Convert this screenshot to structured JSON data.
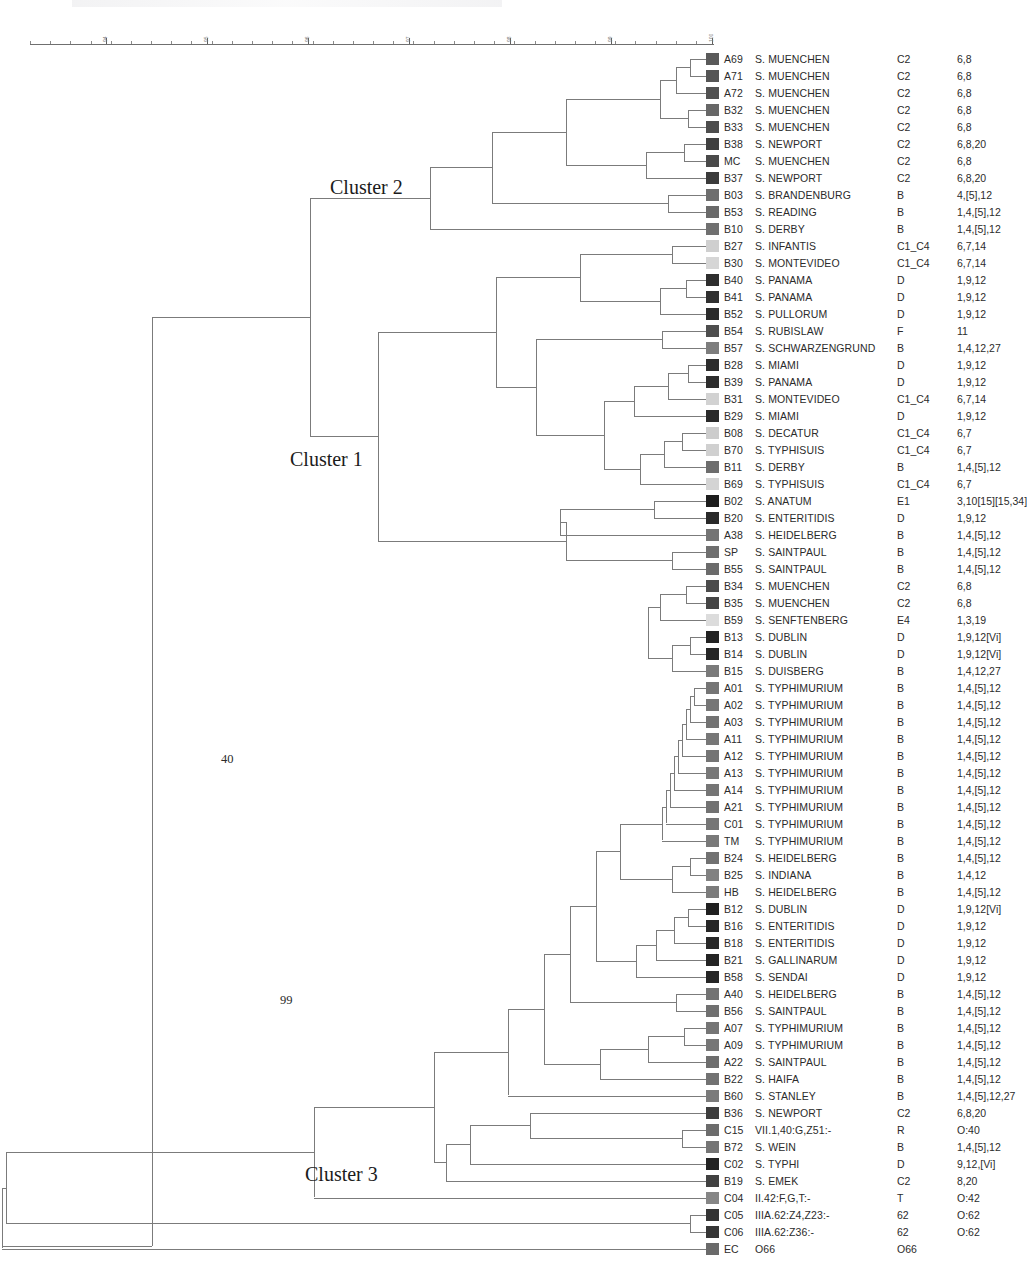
{
  "figure": {
    "type": "dendrogram",
    "line_color": "#7b7b7b",
    "text_color": "#2b2b2b"
  },
  "axis": {
    "orientation": "horizontal-top",
    "label_rotation": "vertical",
    "min": 93.5,
    "max": 100,
    "ticks": [
      {
        "value": "94",
        "x": 106
      },
      {
        "value": "95",
        "x": 207
      },
      {
        "value": "96",
        "x": 308
      },
      {
        "value": "97",
        "x": 409
      },
      {
        "value": "98",
        "x": 510
      },
      {
        "value": "99",
        "x": 611
      },
      {
        "value": "100",
        "x": 712
      }
    ]
  },
  "annotations": {
    "cluster1": "Cluster 1",
    "cluster2": "Cluster 2",
    "cluster3": "Cluster 3",
    "bootstrap_40": "40",
    "bootstrap_99": "99"
  },
  "columns": {
    "id": "Strain ID",
    "name": "Serovar",
    "group": "Serogroup",
    "antigen": "Antigenic formula"
  },
  "chart_data": {
    "type": "dendrogram",
    "title": "",
    "xlabel": "",
    "ylabel": "",
    "xlim": [
      93.5,
      100
    ],
    "leaf_count": 71
  },
  "rows": [
    {
      "id": "A69",
      "name": "S. MUENCHEN",
      "group": "C2",
      "antigen": "6,8",
      "color": "#5a5a5a"
    },
    {
      "id": "A71",
      "name": "S. MUENCHEN",
      "group": "C2",
      "antigen": "6,8",
      "color": "#555555"
    },
    {
      "id": "A72",
      "name": "S. MUENCHEN",
      "group": "C2",
      "antigen": "6,8",
      "color": "#515151"
    },
    {
      "id": "B32",
      "name": "S. MUENCHEN",
      "group": "C2",
      "antigen": "6,8",
      "color": "#676767"
    },
    {
      "id": "B33",
      "name": "S. MUENCHEN",
      "group": "C2",
      "antigen": "6,8",
      "color": "#4d4d4d"
    },
    {
      "id": "B38",
      "name": "S. NEWPORT",
      "group": "C2",
      "antigen": "6,8,20",
      "color": "#3f3f3f"
    },
    {
      "id": "MC",
      "name": "S. MUENCHEN",
      "group": "C2",
      "antigen": "6,8",
      "color": "#4a4a4a"
    },
    {
      "id": "B37",
      "name": "S. NEWPORT",
      "group": "C2",
      "antigen": "6,8,20",
      "color": "#3b3b3b"
    },
    {
      "id": "B03",
      "name": "S. BRANDENBURG",
      "group": "B",
      "antigen": "4,[5],12",
      "color": "#6e6e6e"
    },
    {
      "id": "B53",
      "name": "S. READING",
      "group": "B",
      "antigen": "1,4,[5],12",
      "color": "#6a6a6a"
    },
    {
      "id": "B10",
      "name": "S. DERBY",
      "group": "B",
      "antigen": "1,4,[5],12",
      "color": "#707070"
    },
    {
      "id": "B27",
      "name": "S. INFANTIS",
      "group": "C1_C4",
      "antigen": "6,7,14",
      "color": "#cfcfcf"
    },
    {
      "id": "B30",
      "name": "S. MONTEVIDEO",
      "group": "C1_C4",
      "antigen": "6,7,14",
      "color": "#d6d6d6"
    },
    {
      "id": "B40",
      "name": "S. PANAMA",
      "group": "D",
      "antigen": "1,9,12",
      "color": "#2e2e2e"
    },
    {
      "id": "B41",
      "name": "S. PANAMA",
      "group": "D",
      "antigen": "1,9,12",
      "color": "#303030"
    },
    {
      "id": "B52",
      "name": "S. PULLORUM",
      "group": "D",
      "antigen": "1,9,12",
      "color": "#2b2b2b"
    },
    {
      "id": "B54",
      "name": "S. RUBISLAW",
      "group": "F",
      "antigen": "11",
      "color": "#4e4e4e"
    },
    {
      "id": "B57",
      "name": "S. SCHWARZENGRUND",
      "group": "B",
      "antigen": "1,4,12,27",
      "color": "#7d7d7d"
    },
    {
      "id": "B28",
      "name": "S. MIAMI",
      "group": "D",
      "antigen": "1,9,12",
      "color": "#2c2c2c"
    },
    {
      "id": "B39",
      "name": "S. PANAMA",
      "group": "D",
      "antigen": "1,9,12",
      "color": "#2d2d2d"
    },
    {
      "id": "B31",
      "name": "S. MONTEVIDEO",
      "group": "C1_C4",
      "antigen": "6,7,14",
      "color": "#d2d2d2"
    },
    {
      "id": "B29",
      "name": "S. MIAMI",
      "group": "D",
      "antigen": "1,9,12",
      "color": "#2a2a2a"
    },
    {
      "id": "B08",
      "name": "S. DECATUR",
      "group": "C1_C4",
      "antigen": "6,7",
      "color": "#cccccc"
    },
    {
      "id": "B70",
      "name": "S. TYPHISUIS",
      "group": "C1_C4",
      "antigen": "6,7",
      "color": "#d0d0d0"
    },
    {
      "id": "B11",
      "name": "S. DERBY",
      "group": "B",
      "antigen": "1,4,[5],12",
      "color": "#6d6d6d"
    },
    {
      "id": "B69",
      "name": "S. TYPHISUIS",
      "group": "C1_C4",
      "antigen": "6,7",
      "color": "#d4d4d4"
    },
    {
      "id": "B02",
      "name": "S. ANATUM",
      "group": "E1",
      "antigen": "3,10[15][15,34]",
      "color": "#1d1d1d"
    },
    {
      "id": "B20",
      "name": "S. ENTERITIDIS",
      "group": "D",
      "antigen": "1,9,12",
      "color": "#292929"
    },
    {
      "id": "A38",
      "name": "S. HEIDELBERG",
      "group": "B",
      "antigen": "1,4,[5],12",
      "color": "#747474"
    },
    {
      "id": "SP",
      "name": "S. SAINTPAUL",
      "group": "B",
      "antigen": "1,4,[5],12",
      "color": "#6f6f6f"
    },
    {
      "id": "B55",
      "name": "S. SAINTPAUL",
      "group": "B",
      "antigen": "1,4,[5],12",
      "color": "#6b6b6b"
    },
    {
      "id": "B34",
      "name": "S. MUENCHEN",
      "group": "C2",
      "antigen": "6,8",
      "color": "#4b4b4b"
    },
    {
      "id": "B35",
      "name": "S. MUENCHEN",
      "group": "C2",
      "antigen": "6,8",
      "color": "#454545"
    },
    {
      "id": "B59",
      "name": "S. SENFTENBERG",
      "group": "E4",
      "antigen": "1,3,19",
      "color": "#dcdcdc"
    },
    {
      "id": "B13",
      "name": "S. DUBLIN",
      "group": "D",
      "antigen": "1,9,12[Vi]",
      "color": "#232323"
    },
    {
      "id": "B14",
      "name": "S. DUBLIN",
      "group": "D",
      "antigen": "1,9,12[Vi]",
      "color": "#252525"
    },
    {
      "id": "B15",
      "name": "S. DUISBERG",
      "group": "B",
      "antigen": "1,4,12,27",
      "color": "#7a7a7a"
    },
    {
      "id": "A01",
      "name": "S. TYPHIMURIUM",
      "group": "B",
      "antigen": "1,4,[5],12",
      "color": "#757575"
    },
    {
      "id": "A02",
      "name": "S. TYPHIMURIUM",
      "group": "B",
      "antigen": "1,4,[5],12",
      "color": "#767676"
    },
    {
      "id": "A03",
      "name": "S. TYPHIMURIUM",
      "group": "B",
      "antigen": "1,4,[5],12",
      "color": "#737373"
    },
    {
      "id": "A11",
      "name": "S. TYPHIMURIUM",
      "group": "B",
      "antigen": "1,4,[5],12",
      "color": "#777777"
    },
    {
      "id": "A12",
      "name": "S. TYPHIMURIUM",
      "group": "B",
      "antigen": "1,4,[5],12",
      "color": "#747474"
    },
    {
      "id": "A13",
      "name": "S. TYPHIMURIUM",
      "group": "B",
      "antigen": "1,4,[5],12",
      "color": "#787878"
    },
    {
      "id": "A14",
      "name": "S. TYPHIMURIUM",
      "group": "B",
      "antigen": "1,4,[5],12",
      "color": "#757575"
    },
    {
      "id": "A21",
      "name": "S. TYPHIMURIUM",
      "group": "B",
      "antigen": "1,4,[5],12",
      "color": "#727272"
    },
    {
      "id": "C01",
      "name": "S. TYPHIMURIUM",
      "group": "B",
      "antigen": "1,4,[5],12",
      "color": "#767676"
    },
    {
      "id": "TM",
      "name": "S. TYPHIMURIUM",
      "group": "B",
      "antigen": "1,4,[5],12",
      "color": "#797979"
    },
    {
      "id": "B24",
      "name": "S. HEIDELBERG",
      "group": "B",
      "antigen": "1,4,[5],12",
      "color": "#717171"
    },
    {
      "id": "B25",
      "name": "S. INDIANA",
      "group": "B",
      "antigen": "1,4,12",
      "color": "#818181"
    },
    {
      "id": "HB",
      "name": "S. HEIDELBERG",
      "group": "B",
      "antigen": "1,4,[5],12",
      "color": "#7c7c7c"
    },
    {
      "id": "B12",
      "name": "S. DUBLIN",
      "group": "D",
      "antigen": "1,9,12[Vi]",
      "color": "#202020"
    },
    {
      "id": "B16",
      "name": "S. ENTERITIDIS",
      "group": "D",
      "antigen": "1,9,12",
      "color": "#272727"
    },
    {
      "id": "B18",
      "name": "S. ENTERITIDIS",
      "group": "D",
      "antigen": "1,9,12",
      "color": "#282828"
    },
    {
      "id": "B21",
      "name": "S. GALLINARUM",
      "group": "D",
      "antigen": "1,9,12",
      "color": "#242424"
    },
    {
      "id": "B58",
      "name": "S. SENDAI",
      "group": "D",
      "antigen": "1,9,12",
      "color": "#262626"
    },
    {
      "id": "A40",
      "name": "S. HEIDELBERG",
      "group": "B",
      "antigen": "1,4,[5],12",
      "color": "#737373"
    },
    {
      "id": "B56",
      "name": "S. SAINTPAUL",
      "group": "B",
      "antigen": "1,4,[5],12",
      "color": "#707070"
    },
    {
      "id": "A07",
      "name": "S. TYPHIMURIUM",
      "group": "B",
      "antigen": "1,4,[5],12",
      "color": "#757575"
    },
    {
      "id": "A09",
      "name": "S. TYPHIMURIUM",
      "group": "B",
      "antigen": "1,4,[5],12",
      "color": "#777777"
    },
    {
      "id": "A22",
      "name": "S. SAINTPAUL",
      "group": "B",
      "antigen": "1,4,[5],12",
      "color": "#6e6e6e"
    },
    {
      "id": "B22",
      "name": "S. HAIFA",
      "group": "B",
      "antigen": "1,4,[5],12",
      "color": "#727272"
    },
    {
      "id": "B60",
      "name": "S. STANLEY",
      "group": "B",
      "antigen": "1,4,[5],12,27",
      "color": "#7b7b7b"
    },
    {
      "id": "B36",
      "name": "S. NEWPORT",
      "group": "C2",
      "antigen": "6,8,20",
      "color": "#3d3d3d"
    },
    {
      "id": "C15",
      "name": "VII.1,40:G,Z51:-",
      "group": "R",
      "antigen": "O:40",
      "color": "#6c6c6c"
    },
    {
      "id": "B72",
      "name": "S. WEIN",
      "group": "B",
      "antigen": "1,4,[5],12",
      "color": "#757575"
    },
    {
      "id": "C02",
      "name": "S. TYPHI",
      "group": "D",
      "antigen": "9,12,[Vi]",
      "color": "#222222"
    },
    {
      "id": "B19",
      "name": "S. EMEK",
      "group": "C2",
      "antigen": "8,20",
      "color": "#414141"
    },
    {
      "id": "C04",
      "name": "II.42:F,G,T:-",
      "group": "T",
      "antigen": "O:42",
      "color": "#868686"
    },
    {
      "id": "C05",
      "name": "IIIA.62:Z4,Z23:-",
      "group": "62",
      "antigen": "O:62",
      "color": "#343434"
    },
    {
      "id": "C06",
      "name": "IIIA.62:Z36:-",
      "group": "62",
      "antigen": "O:62",
      "color": "#363636"
    },
    {
      "id": "EC",
      "name": "O66",
      "group": "O66",
      "antigen": "",
      "color": "#6a6a6a"
    }
  ]
}
